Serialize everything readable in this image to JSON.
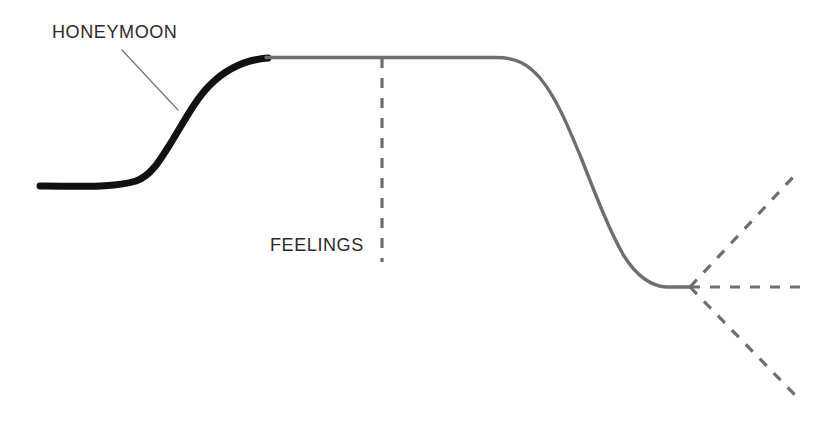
{
  "figure": {
    "background_color": "#ffffff",
    "width": 837,
    "height": 427,
    "labels": {
      "honeymoon": "HONEYMOON",
      "feelings": "FEELINGS"
    }
  },
  "colors": {
    "curve_solid": "#111111",
    "curve_gray": "#6e6e6e",
    "dashed": "#6e6e6e",
    "leader_line": "#777777",
    "text": "#2b2b2b"
  },
  "chart_data": {
    "type": "line",
    "title": "",
    "subtitle": "",
    "xlabel": "",
    "ylabel": "FEELINGS",
    "grid": false,
    "legend": null,
    "axis_ranges": {
      "x": [
        0,
        837
      ],
      "y": [
        427,
        0
      ]
    },
    "annotations": [
      {
        "name": "honeymoon",
        "text": "HONEYMOON",
        "text_x": 52,
        "text_y": 37,
        "leader_line": {
          "from_x": 122,
          "from_y": 50,
          "to_x": 178,
          "to_y": 110,
          "style": "solid",
          "color": "#777777",
          "width": 1.3
        }
      },
      {
        "name": "feelings",
        "text": "FEELINGS",
        "text_x": 270,
        "text_y": 253,
        "leader_line": null
      }
    ],
    "series": [
      {
        "name": "honeymoon-phase",
        "style": "solid",
        "color": "#111111",
        "width": 7,
        "points": [
          [
            40,
            186
          ],
          [
            70,
            186
          ],
          [
            100,
            185
          ],
          [
            125,
            183
          ],
          [
            145,
            176
          ],
          [
            162,
            161
          ],
          [
            178,
            137
          ],
          [
            192,
            112
          ],
          [
            206,
            90
          ],
          [
            222,
            73
          ],
          [
            240,
            63
          ],
          [
            256,
            59
          ],
          [
            268,
            58
          ]
        ]
      },
      {
        "name": "plateau-and-decline",
        "style": "solid",
        "color": "#6e6e6e",
        "width": 3.4,
        "points": [
          [
            268,
            58
          ],
          [
            330,
            57
          ],
          [
            400,
            57
          ],
          [
            460,
            57
          ],
          [
            500,
            58
          ],
          [
            520,
            61
          ],
          [
            538,
            70
          ],
          [
            554,
            87
          ],
          [
            570,
            113
          ],
          [
            586,
            145
          ],
          [
            600,
            177
          ],
          [
            614,
            209
          ],
          [
            628,
            240
          ],
          [
            640,
            262
          ],
          [
            652,
            277
          ],
          [
            664,
            284
          ],
          [
            678,
            287
          ],
          [
            690,
            287
          ]
        ]
      }
    ],
    "dashed_lines": [
      {
        "name": "feelings-axis",
        "from_x": 382,
        "from_y": 58,
        "to_x": 382,
        "to_y": 262,
        "color": "#6e6e6e",
        "width": 3.2,
        "dash": "10 10"
      },
      {
        "name": "branch-up",
        "from_x": 690,
        "from_y": 287,
        "to_x": 796,
        "to_y": 174,
        "color": "#6e6e6e",
        "width": 3.2,
        "dash": "10 10"
      },
      {
        "name": "branch-flat",
        "from_x": 690,
        "from_y": 287,
        "to_x": 801,
        "to_y": 287,
        "color": "#6e6e6e",
        "width": 3.2,
        "dash": "10 10"
      },
      {
        "name": "branch-down",
        "from_x": 690,
        "from_y": 287,
        "to_x": 796,
        "to_y": 396,
        "color": "#6e6e6e",
        "width": 3.2,
        "dash": "10 10"
      }
    ],
    "nodes": [
      {
        "name": "branch-point",
        "x": 690,
        "y": 287
      }
    ]
  }
}
